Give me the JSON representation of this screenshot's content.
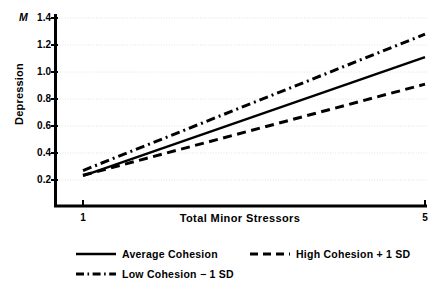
{
  "chart_data": {
    "type": "line",
    "title": "",
    "xlabel": "Total Minor Stressors",
    "ylabel": "Depression",
    "y_unit_label": "M",
    "xlim": [
      1,
      5
    ],
    "ylim": [
      0,
      1.4
    ],
    "x_ticks": [
      "1",
      "5"
    ],
    "x_tick_values": [
      1,
      5
    ],
    "y_ticks": [
      "0.2",
      "0.4",
      "0.6",
      "0.8",
      "1.0",
      "1.2",
      "1.4"
    ],
    "y_tick_values": [
      0.2,
      0.4,
      0.6,
      0.8,
      1.0,
      1.2,
      1.4
    ],
    "grid": true,
    "legend_position": "below",
    "x": [
      1,
      5
    ],
    "series": [
      {
        "name": "Average Cohesion",
        "style": "solid",
        "color": "#000000",
        "values": [
          0.23,
          1.11
        ]
      },
      {
        "name": "High Cohesion + 1 SD",
        "style": "dashed",
        "color": "#000000",
        "values": [
          0.235,
          0.91
        ]
      },
      {
        "name": "Low Cohesion − 1 SD",
        "style": "dashdot",
        "color": "#000000",
        "values": [
          0.27,
          1.28
        ]
      }
    ]
  },
  "legend": {
    "items": [
      {
        "label": "Average Cohesion",
        "key": "solid-line-key"
      },
      {
        "label": "High Cohesion + 1 SD",
        "key": "dashed-line-key"
      },
      {
        "label": "Low Cohesion − 1 SD",
        "key": "dashdot-line-key"
      }
    ]
  }
}
